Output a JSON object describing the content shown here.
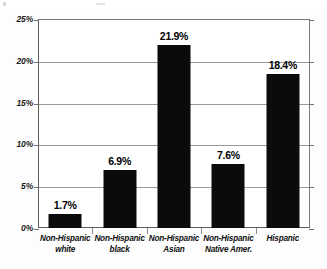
{
  "chart_data": {
    "type": "bar",
    "title": "",
    "subtitle": "",
    "xlabel": "",
    "ylabel": "",
    "categories": [
      "Non-Hispanic white",
      "Non-Hispanic black",
      "Non-Hispanic Asian",
      "Non-Hispanic Native Amer.",
      "Hispanic"
    ],
    "category_lines": [
      [
        "Non-Hispanic",
        "white"
      ],
      [
        "Non-Hispanic",
        "black"
      ],
      [
        "Non-Hispanic",
        "Asian"
      ],
      [
        "Non-Hispanic",
        "Native Amer."
      ],
      [
        "Hispanic",
        ""
      ]
    ],
    "values": [
      1.7,
      6.9,
      21.9,
      7.6,
      18.4
    ],
    "value_labels": [
      "1.7%",
      "6.9%",
      "21.9%",
      "7.6%",
      "18.4%"
    ],
    "ylim": [
      0,
      25
    ],
    "ytick_values": [
      0,
      5,
      10,
      15,
      20,
      25
    ],
    "ytick_labels": [
      "0%",
      "5%",
      "10%",
      "15%",
      "20%",
      "25%"
    ],
    "grid": true,
    "legend": "none",
    "bar_color": "#0b0b0b",
    "grid_color": "#9a9a9a",
    "axis_color": "#5d5d5d",
    "background": "#ffffff"
  }
}
